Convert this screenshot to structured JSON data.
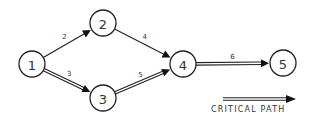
{
  "diagram": {
    "type": "network-activity-diagram",
    "colors": {
      "line": "#222222",
      "background": "#ffffff",
      "text": "#333333"
    },
    "nodes": [
      {
        "id": "1",
        "label": "1",
        "x": 32,
        "y": 64
      },
      {
        "id": "2",
        "label": "2",
        "x": 103,
        "y": 23
      },
      {
        "id": "3",
        "label": "3",
        "x": 103,
        "y": 98
      },
      {
        "id": "4",
        "label": "4",
        "x": 183,
        "y": 64
      },
      {
        "id": "5",
        "label": "5",
        "x": 283,
        "y": 63
      }
    ],
    "edges": [
      {
        "from": "1",
        "to": "2",
        "label": "2",
        "critical": false
      },
      {
        "from": "1",
        "to": "3",
        "label": "3",
        "critical": true
      },
      {
        "from": "2",
        "to": "4",
        "label": "4",
        "critical": false
      },
      {
        "from": "3",
        "to": "4",
        "label": "5",
        "critical": true
      },
      {
        "from": "4",
        "to": "5",
        "label": "6",
        "critical": true
      }
    ],
    "critical_path": [
      "1",
      "3",
      "4",
      "5"
    ],
    "legend": {
      "label": "CRITICAL PATH",
      "symbol": "double-line-arrow"
    }
  }
}
